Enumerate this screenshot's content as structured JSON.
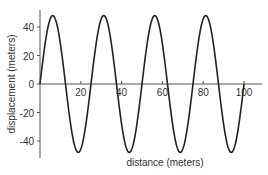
{
  "chart_data": {
    "type": "line",
    "title": "",
    "xlabel": "distance (meters)",
    "ylabel": "displacement (meters)",
    "xlim": [
      0,
      108
    ],
    "ylim": [
      -52,
      52
    ],
    "xticks": [
      20,
      40,
      60,
      80,
      100
    ],
    "yticks": [
      -40,
      -20,
      0,
      20,
      40
    ],
    "x_tick_labels": [
      "20",
      "40",
      "60",
      "80",
      "100"
    ],
    "y_tick_labels": [
      "-40",
      "-20",
      "0",
      "20",
      "40"
    ],
    "grid": false,
    "legend": null,
    "series": [
      {
        "name": "displacement",
        "function": "48*sin(2*pi*x/25)",
        "amplitude": 48,
        "wavelength": 25,
        "x_start": 0,
        "x_end": 100,
        "x": [
          0,
          6.25,
          12.5,
          18.75,
          25,
          31.25,
          37.5,
          43.75,
          50,
          56.25,
          62.5,
          68.75,
          75,
          81.25,
          87.5,
          93.75,
          100
        ],
        "values": [
          0,
          48,
          0,
          -48,
          0,
          48,
          0,
          -48,
          0,
          48,
          0,
          -48,
          0,
          48,
          0,
          -48,
          0
        ],
        "color": "#222222"
      }
    ]
  }
}
